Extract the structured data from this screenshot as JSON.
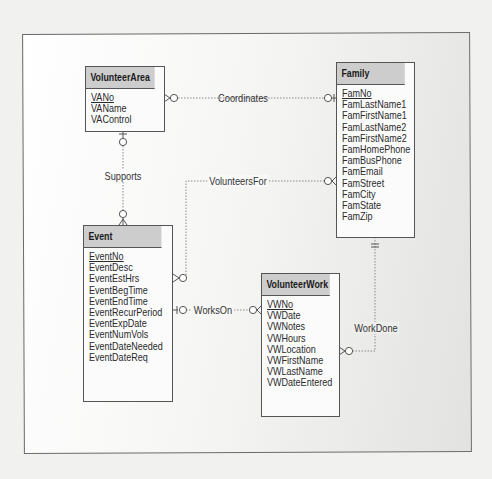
{
  "diagram": {
    "type": "entity-relationship (crow's foot)",
    "colors": {
      "entity_header": "#cdcdcd",
      "entity_border": "#555555",
      "line": "#8a8a8a",
      "frame_border": "#6b6b6b"
    },
    "entities": [
      {
        "id": "volunteer-area",
        "name": "VolunteerArea",
        "primary_key": "VANo",
        "attributes": [
          "VANo",
          "VAName",
          "VAControl"
        ]
      },
      {
        "id": "family",
        "name": "Family",
        "primary_key": "FamNo",
        "attributes": [
          "FamNo",
          "FamLastName1",
          "FamFirstName1",
          "FamLastName2",
          "FamFirstName2",
          "FamHomePhone",
          "FamBusPhone",
          "FamEmail",
          "FamStreet",
          "FamCity",
          "FamState",
          "FamZip"
        ]
      },
      {
        "id": "event",
        "name": "Event",
        "primary_key": "EventNo",
        "attributes": [
          "EventNo",
          "EventDesc",
          "EventEstHrs",
          "EventBegTime",
          "EventEndTime",
          "EventRecurPeriod",
          "EventExpDate",
          "EventNumVols",
          "EventDateNeeded",
          "EventDateReq"
        ]
      },
      {
        "id": "volunteer-work",
        "name": "VolunteerWork",
        "primary_key": "VWNo",
        "attributes": [
          "VWNo",
          "VWDate",
          "VWNotes",
          "VWHours",
          "VWLocation",
          "VWFirstName",
          "VWLastName",
          "VWDateEntered"
        ]
      }
    ],
    "relationships": [
      {
        "name": "Coordinates",
        "from": "VolunteerArea",
        "from_card": "zero-or-many",
        "to": "Family",
        "to_card": "zero-or-one"
      },
      {
        "name": "Supports",
        "from": "VolunteerArea",
        "from_card": "zero-or-one",
        "to": "Event",
        "to_card": "zero-or-many"
      },
      {
        "name": "VolunteersFor",
        "from": "Event",
        "from_card": "zero-or-many",
        "to": "Family",
        "to_card": "zero-or-many"
      },
      {
        "name": "WorksOn",
        "from": "Event",
        "from_card": "zero-or-one",
        "to": "VolunteerWork",
        "to_card": "zero-or-many"
      },
      {
        "name": "WorkDone",
        "from": "Family",
        "from_card": "exactly-one",
        "to": "VolunteerWork",
        "to_card": "zero-or-many"
      }
    ]
  }
}
